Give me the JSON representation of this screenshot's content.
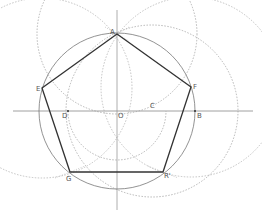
{
  "diagram": {
    "colors": {
      "background": "#ffffff",
      "pentagon": "#333333",
      "circle": "#777777",
      "axes": "#888888",
      "dotted": "#999999",
      "label": "#555555"
    },
    "points": {
      "A": {
        "label": "A",
        "x": 117,
        "y": 34
      },
      "B": {
        "label": "B",
        "x": 195,
        "y": 111
      },
      "C": {
        "label": "C",
        "x": 152,
        "y": 111
      },
      "D": {
        "label": "D",
        "x": 68,
        "y": 111
      },
      "E": {
        "label": "E",
        "x": 42,
        "y": 88
      },
      "F": {
        "label": "F",
        "x": 191,
        "y": 87
      },
      "G": {
        "label": "G",
        "x": 70,
        "y": 172
      },
      "R": {
        "label": "R'",
        "x": 163,
        "y": 172
      },
      "O": {
        "label": "O",
        "x": 117,
        "y": 111
      }
    }
  }
}
